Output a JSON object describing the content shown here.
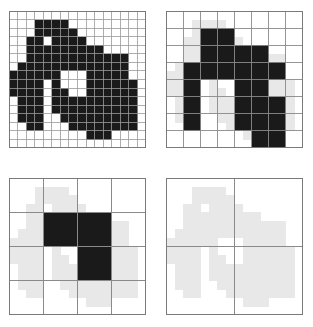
{
  "figure": {
    "title": "",
    "width": 313,
    "height": 327,
    "background_color": "#ffffff",
    "panel_count": 4
  },
  "colors": {
    "background": "#ffffff",
    "fill_dark": "#1a1a1a",
    "fill_halo": "#e8e8e8",
    "grid_line_fine": "#9a9a9a",
    "grid_line_coarse": "#8a8a8a",
    "border": "#7a7a7a"
  },
  "chart_data": {
    "type": "heatmap",
    "title": "",
    "xlabel": "",
    "ylabel": "",
    "grid": true,
    "legend_position": "none",
    "panels": [
      {
        "name": "panel-top-left",
        "label": "",
        "resolution": 16,
        "rows": 16,
        "cols": 16,
        "cell_size_px": 8.5625,
        "origin_x": 9,
        "origin_y": 11,
        "size_px": 137,
        "show_halo": false,
        "grid_line_color": "#9a9a9a",
        "grid_line_width": 0.8,
        "filled_cells": [
          [
            1,
            3
          ],
          [
            1,
            4
          ],
          [
            1,
            5
          ],
          [
            1,
            6
          ],
          [
            2,
            3
          ],
          [
            2,
            4
          ],
          [
            2,
            5
          ],
          [
            2,
            6
          ],
          [
            2,
            7
          ],
          [
            3,
            2
          ],
          [
            3,
            3
          ],
          [
            3,
            5
          ],
          [
            3,
            6
          ],
          [
            3,
            7
          ],
          [
            3,
            8
          ],
          [
            4,
            2
          ],
          [
            4,
            3
          ],
          [
            4,
            4
          ],
          [
            4,
            5
          ],
          [
            4,
            6
          ],
          [
            4,
            7
          ],
          [
            4,
            8
          ],
          [
            4,
            9
          ],
          [
            4,
            10
          ],
          [
            5,
            2
          ],
          [
            5,
            3
          ],
          [
            5,
            4
          ],
          [
            5,
            5
          ],
          [
            5,
            6
          ],
          [
            5,
            7
          ],
          [
            5,
            8
          ],
          [
            5,
            9
          ],
          [
            5,
            10
          ],
          [
            5,
            11
          ],
          [
            5,
            12
          ],
          [
            5,
            13
          ],
          [
            6,
            1
          ],
          [
            6,
            2
          ],
          [
            6,
            3
          ],
          [
            6,
            4
          ],
          [
            6,
            5
          ],
          [
            6,
            6
          ],
          [
            6,
            7
          ],
          [
            6,
            8
          ],
          [
            6,
            9
          ],
          [
            6,
            10
          ],
          [
            6,
            11
          ],
          [
            6,
            12
          ],
          [
            6,
            13
          ],
          [
            7,
            0
          ],
          [
            7,
            1
          ],
          [
            7,
            2
          ],
          [
            7,
            3
          ],
          [
            7,
            4
          ],
          [
            7,
            5
          ],
          [
            7,
            9
          ],
          [
            7,
            10
          ],
          [
            7,
            11
          ],
          [
            7,
            12
          ],
          [
            7,
            13
          ],
          [
            8,
            0
          ],
          [
            8,
            1
          ],
          [
            8,
            2
          ],
          [
            8,
            3
          ],
          [
            8,
            5
          ],
          [
            8,
            9
          ],
          [
            8,
            10
          ],
          [
            8,
            11
          ],
          [
            8,
            12
          ],
          [
            8,
            13
          ],
          [
            8,
            14
          ],
          [
            9,
            0
          ],
          [
            9,
            1
          ],
          [
            9,
            2
          ],
          [
            9,
            3
          ],
          [
            9,
            5
          ],
          [
            9,
            6
          ],
          [
            9,
            9
          ],
          [
            9,
            10
          ],
          [
            9,
            11
          ],
          [
            9,
            12
          ],
          [
            9,
            13
          ],
          [
            9,
            14
          ],
          [
            10,
            1
          ],
          [
            10,
            2
          ],
          [
            10,
            3
          ],
          [
            10,
            5
          ],
          [
            10,
            6
          ],
          [
            10,
            7
          ],
          [
            10,
            8
          ],
          [
            10,
            9
          ],
          [
            10,
            10
          ],
          [
            10,
            11
          ],
          [
            10,
            12
          ],
          [
            10,
            13
          ],
          [
            10,
            14
          ],
          [
            11,
            1
          ],
          [
            11,
            2
          ],
          [
            11,
            3
          ],
          [
            11,
            5
          ],
          [
            11,
            6
          ],
          [
            11,
            7
          ],
          [
            11,
            8
          ],
          [
            11,
            9
          ],
          [
            11,
            10
          ],
          [
            11,
            11
          ],
          [
            11,
            12
          ],
          [
            11,
            13
          ],
          [
            11,
            14
          ],
          [
            12,
            1
          ],
          [
            12,
            2
          ],
          [
            12,
            3
          ],
          [
            12,
            6
          ],
          [
            12,
            7
          ],
          [
            12,
            8
          ],
          [
            12,
            9
          ],
          [
            12,
            10
          ],
          [
            12,
            11
          ],
          [
            12,
            12
          ],
          [
            12,
            13
          ],
          [
            12,
            14
          ],
          [
            13,
            2
          ],
          [
            13,
            3
          ],
          [
            13,
            7
          ],
          [
            13,
            8
          ],
          [
            13,
            9
          ],
          [
            13,
            10
          ],
          [
            13,
            11
          ],
          [
            13,
            12
          ],
          [
            13,
            13
          ],
          [
            13,
            14
          ],
          [
            14,
            9
          ],
          [
            14,
            10
          ],
          [
            14,
            11
          ]
        ]
      },
      {
        "name": "panel-top-right",
        "label": "",
        "resolution": 8,
        "rows": 8,
        "cols": 8,
        "cell_size_px": 17.125,
        "origin_x": 166,
        "origin_y": 11,
        "size_px": 137,
        "show_halo": true,
        "halo_resolution": 16,
        "grid_line_color": "#8a8a8a",
        "grid_line_width": 0.9,
        "filled_cells": [
          [
            1,
            2
          ],
          [
            1,
            3
          ],
          [
            2,
            2
          ],
          [
            2,
            3
          ],
          [
            2,
            4
          ],
          [
            2,
            5
          ],
          [
            3,
            1
          ],
          [
            3,
            2
          ],
          [
            3,
            3
          ],
          [
            3,
            4
          ],
          [
            3,
            5
          ],
          [
            3,
            6
          ],
          [
            4,
            1
          ],
          [
            4,
            4
          ],
          [
            4,
            5
          ],
          [
            5,
            1
          ],
          [
            5,
            4
          ],
          [
            5,
            5
          ],
          [
            5,
            6
          ],
          [
            6,
            1
          ],
          [
            6,
            4
          ],
          [
            6,
            5
          ],
          [
            6,
            6
          ],
          [
            7,
            5
          ],
          [
            7,
            6
          ]
        ]
      },
      {
        "name": "panel-bottom-left",
        "label": "",
        "resolution": 4,
        "rows": 4,
        "cols": 4,
        "cell_size_px": 34.25,
        "origin_x": 9,
        "origin_y": 178,
        "size_px": 137,
        "show_halo": true,
        "halo_resolution": 16,
        "grid_line_color": "#8a8a8a",
        "grid_line_width": 1.0,
        "filled_cells": [
          [
            1,
            1
          ],
          [
            1,
            2
          ],
          [
            2,
            2
          ]
        ]
      },
      {
        "name": "panel-bottom-right",
        "label": "",
        "resolution": 2,
        "rows": 2,
        "cols": 2,
        "cell_size_px": 68.5,
        "origin_x": 166,
        "origin_y": 178,
        "size_px": 137,
        "show_halo": true,
        "halo_resolution": 16,
        "grid_line_color": "#8a8a8a",
        "grid_line_width": 1.0,
        "filled_cells": []
      }
    ],
    "shape_mask_16": [
      [
        1,
        3
      ],
      [
        1,
        4
      ],
      [
        1,
        5
      ],
      [
        1,
        6
      ],
      [
        2,
        3
      ],
      [
        2,
        4
      ],
      [
        2,
        5
      ],
      [
        2,
        6
      ],
      [
        2,
        7
      ],
      [
        3,
        2
      ],
      [
        3,
        3
      ],
      [
        3,
        5
      ],
      [
        3,
        6
      ],
      [
        3,
        7
      ],
      [
        3,
        8
      ],
      [
        4,
        2
      ],
      [
        4,
        3
      ],
      [
        4,
        4
      ],
      [
        4,
        5
      ],
      [
        4,
        6
      ],
      [
        4,
        7
      ],
      [
        4,
        8
      ],
      [
        4,
        9
      ],
      [
        4,
        10
      ],
      [
        5,
        2
      ],
      [
        5,
        3
      ],
      [
        5,
        4
      ],
      [
        5,
        5
      ],
      [
        5,
        6
      ],
      [
        5,
        7
      ],
      [
        5,
        8
      ],
      [
        5,
        9
      ],
      [
        5,
        10
      ],
      [
        5,
        11
      ],
      [
        5,
        12
      ],
      [
        5,
        13
      ],
      [
        6,
        1
      ],
      [
        6,
        2
      ],
      [
        6,
        3
      ],
      [
        6,
        4
      ],
      [
        6,
        5
      ],
      [
        6,
        6
      ],
      [
        6,
        7
      ],
      [
        6,
        8
      ],
      [
        6,
        9
      ],
      [
        6,
        10
      ],
      [
        6,
        11
      ],
      [
        6,
        12
      ],
      [
        6,
        13
      ],
      [
        7,
        0
      ],
      [
        7,
        1
      ],
      [
        7,
        2
      ],
      [
        7,
        3
      ],
      [
        7,
        4
      ],
      [
        7,
        5
      ],
      [
        7,
        9
      ],
      [
        7,
        10
      ],
      [
        7,
        11
      ],
      [
        7,
        12
      ],
      [
        7,
        13
      ],
      [
        8,
        0
      ],
      [
        8,
        1
      ],
      [
        8,
        2
      ],
      [
        8,
        3
      ],
      [
        8,
        5
      ],
      [
        8,
        9
      ],
      [
        8,
        10
      ],
      [
        8,
        11
      ],
      [
        8,
        12
      ],
      [
        8,
        13
      ],
      [
        8,
        14
      ],
      [
        9,
        0
      ],
      [
        9,
        1
      ],
      [
        9,
        2
      ],
      [
        9,
        3
      ],
      [
        9,
        5
      ],
      [
        9,
        6
      ],
      [
        9,
        9
      ],
      [
        9,
        10
      ],
      [
        9,
        11
      ],
      [
        9,
        12
      ],
      [
        9,
        13
      ],
      [
        9,
        14
      ],
      [
        10,
        1
      ],
      [
        10,
        2
      ],
      [
        10,
        3
      ],
      [
        10,
        5
      ],
      [
        10,
        6
      ],
      [
        10,
        7
      ],
      [
        10,
        8
      ],
      [
        10,
        9
      ],
      [
        10,
        10
      ],
      [
        10,
        11
      ],
      [
        10,
        12
      ],
      [
        10,
        13
      ],
      [
        10,
        14
      ],
      [
        11,
        1
      ],
      [
        11,
        2
      ],
      [
        11,
        3
      ],
      [
        11,
        5
      ],
      [
        11,
        6
      ],
      [
        11,
        7
      ],
      [
        11,
        8
      ],
      [
        11,
        9
      ],
      [
        11,
        10
      ],
      [
        11,
        11
      ],
      [
        11,
        12
      ],
      [
        11,
        13
      ],
      [
        11,
        14
      ],
      [
        12,
        1
      ],
      [
        12,
        2
      ],
      [
        12,
        3
      ],
      [
        12,
        6
      ],
      [
        12,
        7
      ],
      [
        12,
        8
      ],
      [
        12,
        9
      ],
      [
        12,
        10
      ],
      [
        12,
        11
      ],
      [
        12,
        12
      ],
      [
        12,
        13
      ],
      [
        12,
        14
      ],
      [
        13,
        2
      ],
      [
        13,
        3
      ],
      [
        13,
        7
      ],
      [
        13,
        8
      ],
      [
        13,
        9
      ],
      [
        13,
        10
      ],
      [
        13,
        11
      ],
      [
        13,
        12
      ],
      [
        13,
        13
      ],
      [
        13,
        14
      ],
      [
        14,
        9
      ],
      [
        14,
        10
      ],
      [
        14,
        11
      ]
    ]
  }
}
